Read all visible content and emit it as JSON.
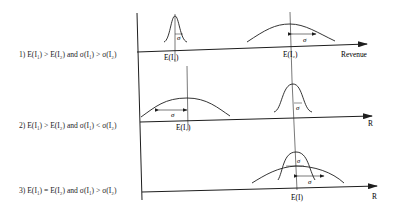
{
  "diagram": {
    "title": "",
    "cases": [
      {
        "id": 1,
        "label": "1) E(I₁) > E(I₂) and σ(I₁) > σ(I₂)",
        "axis_label": "Revenue",
        "mean_labels": [
          "E(I₁)",
          "E(I₂)"
        ],
        "sigma_label": "σ"
      },
      {
        "id": 2,
        "label": "2) E(I₁) > E(I₂) and σ(I₁) < σ(I₂)",
        "axis_label": "R",
        "mean_labels": [
          "E(I₁)"
        ],
        "sigma_label": "σ"
      },
      {
        "id": 3,
        "label": "3) E(I₁) = E(I₂) and σ(I₁) > σ(I₂)",
        "axis_label": "R",
        "mean_labels": [
          "E(I)"
        ],
        "sigma_label": "σ"
      }
    ],
    "colors": {
      "ink": "#1e1e1e",
      "background": "#ffffff"
    }
  }
}
